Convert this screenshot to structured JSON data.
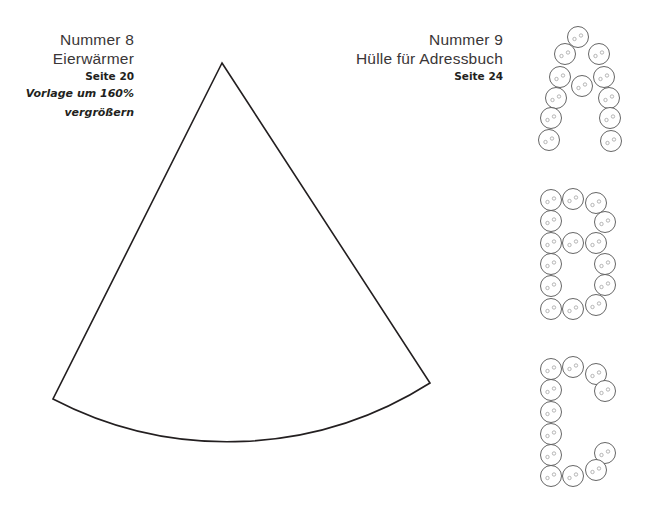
{
  "items": [
    {
      "number": "Nummer 8",
      "name": "Eierwärmer",
      "page": "Seite 20",
      "note_line1": "Vorlage um 160%",
      "note_line2": "vergrößern"
    },
    {
      "number": "Nummer 9",
      "name": "Hülle für Adressbuch",
      "page": "Seite 24"
    }
  ],
  "template": {
    "shape": "circular-sector",
    "stroke_color": "#231f20",
    "apex": [
      222,
      63
    ],
    "left_corner": [
      53,
      399
    ],
    "right_corner": [
      430,
      383
    ]
  },
  "button_letters": [
    "A",
    "B",
    "C"
  ],
  "button_color": "#555555"
}
